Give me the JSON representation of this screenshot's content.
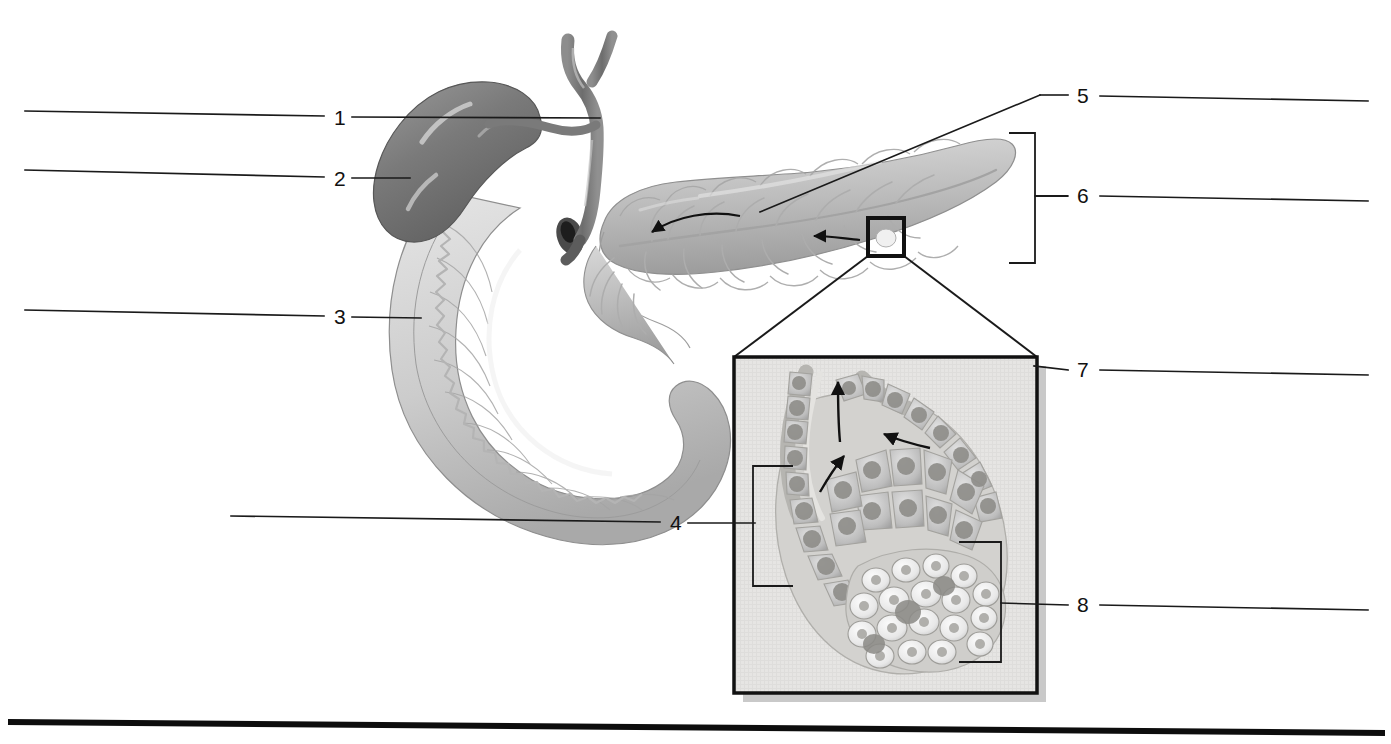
{
  "figure": {
    "background_color": "#ffffff",
    "line_color": "#1a1a1a",
    "width": 1391,
    "height": 744
  },
  "labels": [
    {
      "id": "label-1",
      "number": "1",
      "x": 334,
      "y": 107,
      "side": "left",
      "answer_line": {
        "x1": 25,
        "y1": 111,
        "x2": 324,
        "y2": 116
      },
      "leader_line": {
        "x1": 352,
        "y1": 117,
        "x2": 597,
        "y2": 118
      }
    },
    {
      "id": "label-2",
      "number": "2",
      "x": 334,
      "y": 168,
      "side": "left",
      "answer_line": {
        "x1": 25,
        "y1": 170,
        "x2": 324,
        "y2": 177
      },
      "leader_line": {
        "x1": 352,
        "y1": 178,
        "x2": 408,
        "y2": 178
      }
    },
    {
      "id": "label-3",
      "number": "3",
      "x": 334,
      "y": 306,
      "side": "left",
      "answer_line": {
        "x1": 25,
        "y1": 310,
        "x2": 324,
        "y2": 316
      },
      "leader_line": {
        "x1": 352,
        "y1": 317,
        "x2": 420,
        "y2": 318
      }
    },
    {
      "id": "label-4",
      "number": "4",
      "x": 670,
      "y": 512,
      "side": "left",
      "answer_line": {
        "x1": 231,
        "y1": 516,
        "x2": 660,
        "y2": 522
      },
      "leader_line": {
        "x1": 688,
        "y1": 523,
        "x2": 755,
        "y2": 523
      }
    },
    {
      "id": "label-5",
      "number": "5",
      "x": 1077,
      "y": 85,
      "side": "right",
      "answer_line": {
        "x1": 1100,
        "y1": 96,
        "x2": 1368,
        "y2": 101
      },
      "leader_line": {
        "x1": 1068,
        "y1": 95,
        "x2": 1040,
        "y2": 95
      }
    },
    {
      "id": "label-6",
      "number": "6",
      "x": 1077,
      "y": 185,
      "side": "right",
      "answer_line": {
        "x1": 1100,
        "y1": 196,
        "x2": 1368,
        "y2": 201
      },
      "leader_line": {
        "x1": 1068,
        "y1": 196,
        "x2": 1035,
        "y2": 196
      }
    },
    {
      "id": "label-7",
      "number": "7",
      "x": 1077,
      "y": 359,
      "side": "right",
      "answer_line": {
        "x1": 1100,
        "y1": 370,
        "x2": 1368,
        "y2": 375
      },
      "leader_line": {
        "x1": 1068,
        "y1": 370,
        "x2": 1030,
        "y2": 366
      }
    },
    {
      "id": "label-8",
      "number": "8",
      "x": 1077,
      "y": 594,
      "side": "right",
      "answer_line": {
        "x1": 1100,
        "y1": 605,
        "x2": 1368,
        "y2": 610
      },
      "leader_line": {
        "x1": 1068,
        "y1": 605,
        "x2": 1000,
        "y2": 603
      }
    }
  ],
  "brackets": {
    "pancreas_bracket": {
      "name": "pancreas-extent-bracket",
      "top_x": 1009,
      "top_y": 133,
      "bottom_x": 1009,
      "bottom_y": 263,
      "spine_x": 1035
    },
    "inset_acinus_bracket": {
      "name": "acinus-bracket",
      "left_x": 753,
      "top_y": 466,
      "bottom_y": 586,
      "right_x": 793
    },
    "inset_islet_box": {
      "name": "islet-box",
      "left_x": 959,
      "top_y": 542,
      "right_x": 1001,
      "bottom_y": 662
    }
  },
  "callout": {
    "source_box": {
      "x": 868,
      "y": 218,
      "w": 36,
      "h": 38
    },
    "inset_box": {
      "x": 734,
      "y": 357,
      "w": 303,
      "h": 336
    },
    "shadow_offset": 9
  },
  "anatomy": {
    "main_structures": [
      "gallbladder",
      "common-bile-duct",
      "duodenum",
      "pancreas-head",
      "pancreas-body",
      "pancreas-tail",
      "pancreatic-duct"
    ],
    "inset_structures": [
      "acinar-cells",
      "acinus-lumen",
      "intercalated-duct",
      "islet-of-langerhans",
      "secretion-flow-arrows"
    ]
  },
  "colors": {
    "ink": "#1a1a1a",
    "gallbladder_dark": "#6f6f6f",
    "gallbladder_mid": "#8b8b8b",
    "duct_gray": "#7c7c7c",
    "duodenum_light": "#dcdcdc",
    "duodenum_mid": "#c2c2c2",
    "duodenum_shade": "#a8a8a8",
    "pancreas_light": "#d2d2d2",
    "pancreas_mid": "#b6b6b6",
    "pancreas_dark": "#9a9a9a",
    "inset_bg": "#e4e4e2",
    "inset_shadow": "#c9c9c9",
    "cell_body": "#c0c0c0",
    "cell_nucleus": "#8f8f8f",
    "islet_cell": "#f2f2f2",
    "islet_nucleus": "#a6a6a6"
  },
  "bottom_rule": {
    "x1": 8,
    "y1": 722,
    "x2": 1385,
    "y2": 733,
    "thickness": 6
  }
}
